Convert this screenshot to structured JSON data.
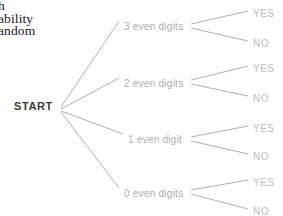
{
  "canvas": {
    "width": 283,
    "height": 216,
    "background": "#ffffff"
  },
  "heading_fragment": {
    "name": "cropped-heading",
    "lines": [
      "h",
      "ability",
      "andom"
    ],
    "color": "#1a1a1a"
  },
  "diagram": {
    "type": "probability-tree",
    "line_color": "#9a9a9a",
    "root": {
      "label": "START",
      "x": 14,
      "y": 101,
      "color": "#3a3a3a"
    },
    "branches": [
      {
        "label": "3 even digits",
        "label_x": 124,
        "label_y": 22,
        "color": "#adadad",
        "leaves": [
          {
            "label": "YES",
            "x": 253,
            "y": 9,
            "color": "#bdbdbd"
          },
          {
            "label": "NO",
            "x": 253,
            "y": 39,
            "color": "#bdbdbd"
          }
        ]
      },
      {
        "label": "2 even digits",
        "label_x": 124,
        "label_y": 79,
        "color": "#adadad",
        "leaves": [
          {
            "label": "YES",
            "x": 253,
            "y": 64,
            "color": "#bdbdbd"
          },
          {
            "label": "NO",
            "x": 253,
            "y": 94,
            "color": "#bdbdbd"
          }
        ]
      },
      {
        "label": "1 even digit",
        "label_x": 128,
        "label_y": 135,
        "color": "#adadad",
        "leaves": [
          {
            "label": "YES",
            "x": 253,
            "y": 124,
            "color": "#bdbdbd"
          },
          {
            "label": "NO",
            "x": 253,
            "y": 152,
            "color": "#bdbdbd"
          }
        ]
      },
      {
        "label": "0 even digits",
        "label_x": 124,
        "label_y": 189,
        "color": "#adadad",
        "leaves": [
          {
            "label": "YES",
            "x": 253,
            "y": 178,
            "color": "#bdbdbd"
          },
          {
            "label": "NO",
            "x": 253,
            "y": 207,
            "color": "#bdbdbd"
          }
        ]
      }
    ]
  }
}
